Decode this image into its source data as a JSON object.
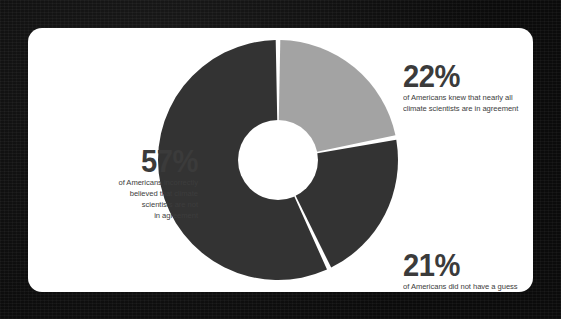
{
  "background": {
    "color": "#0d0d0d",
    "texture": "dark-noise"
  },
  "card": {
    "name": "infographic-card",
    "color": "#ffffff",
    "corner_radius_px": 14
  },
  "chart_data": {
    "type": "pie",
    "variant": "donut",
    "title": "",
    "subtitle": "",
    "xlabel": "",
    "ylabel": "",
    "units": "percent",
    "start_angle_deg": 0,
    "direction": "clockwise",
    "inner_radius_ratio": 0.33,
    "gap_deg": 2.2,
    "legend_position": "callout-labels",
    "grid": false,
    "categories": [
      "Americans who knew that nearly all climate scientists are in agreement",
      "Americans who did not have a guess",
      "Americans who incorrectly believed that climate scientists are not in agreement"
    ],
    "values": [
      22,
      21,
      57
    ],
    "colors": [
      "#a3a3a3",
      "#333333",
      "#333333"
    ],
    "slices": [
      {
        "id": "slice-22",
        "percent": 22,
        "label": "22%",
        "color": "#a3a3a3",
        "start_deg": 0,
        "end_deg": 79.2
      },
      {
        "id": "slice-21",
        "percent": 21,
        "label": "21%",
        "color": "#333333",
        "start_deg": 79.2,
        "end_deg": 154.8
      },
      {
        "id": "slice-57",
        "percent": 57,
        "label": "57%",
        "color": "#333333",
        "start_deg": 154.8,
        "end_deg": 360
      }
    ]
  },
  "labels": {
    "knew": {
      "value": "22%",
      "lines": [
        "of Americans knew that nearly all",
        "climate scientists are in agreement"
      ]
    },
    "no_guess": {
      "value": "21%",
      "lines": [
        "of Americans did not have a guess"
      ]
    },
    "incorrect": {
      "value": "57%",
      "lines": [
        "of Americans incorrectly",
        "believed that climate",
        "scientists are not",
        "in agreement"
      ]
    }
  },
  "colors": {
    "slice_light": "#a3a3a3",
    "slice_dark": "#333333",
    "text": "#3b3b3b",
    "card": "#ffffff",
    "background": "#0d0d0d"
  }
}
